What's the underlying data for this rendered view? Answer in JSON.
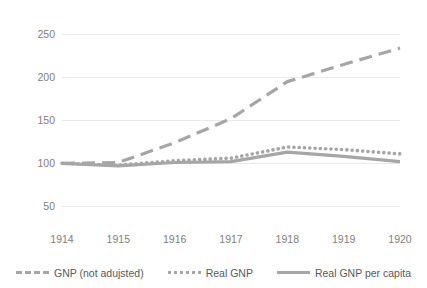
{
  "chart_data": {
    "type": "line",
    "title": "",
    "xlabel": "",
    "ylabel": "",
    "x": [
      1914,
      1915,
      1916,
      1917,
      1918,
      1919,
      1920
    ],
    "categories": [
      "1914",
      "1915",
      "1916",
      "1917",
      "1918",
      "1919",
      "1920"
    ],
    "xticklabels": [
      "1914",
      "1915",
      "1916",
      "1917",
      "1918",
      "1919",
      "1920"
    ],
    "yticklabels": [
      "50",
      "100",
      "150",
      "200",
      "250"
    ],
    "yticks": [
      50,
      100,
      150,
      200,
      250
    ],
    "ylim": [
      26,
      262
    ],
    "grid": "horizontal",
    "legend_position": "bottom",
    "series": [
      {
        "name": "GNP (not adujsted)",
        "style": "dashed",
        "color": "#a6a6a6",
        "values": [
          100,
          101,
          124,
          152,
          195,
          215,
          234
        ]
      },
      {
        "name": "Real GNP",
        "style": "dotted",
        "color": "#a6a6a6",
        "values": [
          100,
          98,
          103,
          106,
          119,
          116,
          111
        ]
      },
      {
        "name": "Real GNP per capita",
        "style": "solid",
        "color": "#a6a6a6",
        "values": [
          100,
          97,
          101,
          102,
          113,
          108,
          102
        ]
      }
    ]
  },
  "axes": {
    "y_ticks": [
      "250",
      "200",
      "150",
      "100",
      "50"
    ],
    "x_ticks": [
      "1914",
      "1915",
      "1916",
      "1917",
      "1918",
      "1919",
      "1920"
    ]
  },
  "legend": {
    "items": [
      {
        "label": "GNP (not adujsted)",
        "style": "dashed"
      },
      {
        "label": "Real GNP",
        "style": "dotted"
      },
      {
        "label": "Real GNP per capita",
        "style": "solid"
      }
    ]
  },
  "colors": {
    "series": "#a6a6a6",
    "grid": "#e9e9e9",
    "tick_text": "#808080",
    "legend_text": "#595959"
  }
}
